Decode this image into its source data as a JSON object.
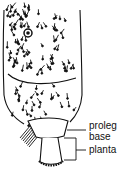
{
  "figure": {
    "labels": {
      "proleg": "proleg",
      "base": "base",
      "planta": "planta"
    },
    "ink_color": "#111111",
    "background_color": "#ffffff"
  }
}
